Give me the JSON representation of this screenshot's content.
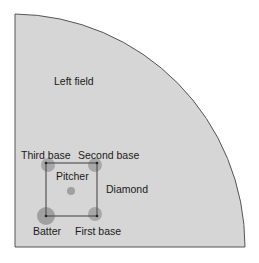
{
  "diagram": {
    "field": {
      "shape": "quarter-circle",
      "fill": "#d6d6d6",
      "stroke": "#555555"
    },
    "labels": {
      "left_field": "Left field",
      "third_base": "Third base",
      "second_base": "Second base",
      "pitcher": "Pitcher",
      "diamond": "Diamond",
      "batter": "Batter",
      "first_base": "First base"
    },
    "colors": {
      "diamond_stroke": "#555555",
      "marker": "#a0a0a0"
    }
  }
}
